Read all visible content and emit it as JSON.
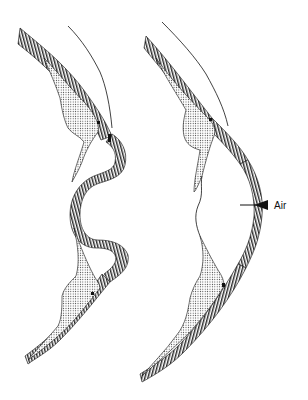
{
  "figure": {
    "panels": [
      {
        "id": "left",
        "description": "anatomical cross-section, tissue folded inward (S-shaped)"
      },
      {
        "id": "right",
        "description": "anatomical cross-section, tissue bowed outward with air"
      }
    ],
    "annotations": [
      {
        "text": "Air",
        "panel": "right",
        "pointer": "arrow-left"
      }
    ],
    "legend": {
      "hatched": "striped tissue layer",
      "stippled": "dotted tissue mass"
    },
    "colors": {
      "ink": "#111111",
      "paper": "#ffffff"
    }
  }
}
